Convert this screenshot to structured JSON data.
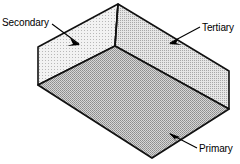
{
  "diagram": {
    "type": "isometric-open-box",
    "background_color": "#ffffff",
    "outline_color": "#000000",
    "faces": [
      {
        "id": "secondary",
        "label": "Secondary",
        "position": "left-wall",
        "fill_color": "#efefef",
        "texture": "fine-stipple-light",
        "leader": {
          "label_anchor": {
            "x": 52,
            "y": 24
          },
          "arrow_tip": {
            "x": 79,
            "y": 44
          }
        }
      },
      {
        "id": "tertiary",
        "label": "Tertiary",
        "position": "right-wall",
        "fill_color": "#dcdcdc",
        "texture": "fine-stipple-medium",
        "leader": {
          "label_anchor": {
            "x": 200,
            "y": 27
          },
          "arrow_tip": {
            "x": 170,
            "y": 43
          }
        }
      },
      {
        "id": "primary",
        "label": "Primary",
        "position": "floor",
        "fill_color": "#c9c9c9",
        "texture": "fine-stipple-dark",
        "leader": {
          "label_anchor": {
            "x": 197,
            "y": 148
          },
          "arrow_tip": {
            "x": 170,
            "y": 134
          }
        }
      }
    ],
    "geometry": {
      "apex_back_top": {
        "x": 118,
        "y": 4
      },
      "inner_corner": {
        "x": 115,
        "y": 46
      },
      "left_wall_top_left": {
        "x": 38,
        "y": 47
      },
      "left_wall_bottom_left": {
        "x": 38,
        "y": 85
      },
      "right_wall_top_right": {
        "x": 229,
        "y": 71
      },
      "right_wall_bottom_right": {
        "x": 229,
        "y": 109
      },
      "floor_front": {
        "x": 152,
        "y": 158
      }
    }
  }
}
